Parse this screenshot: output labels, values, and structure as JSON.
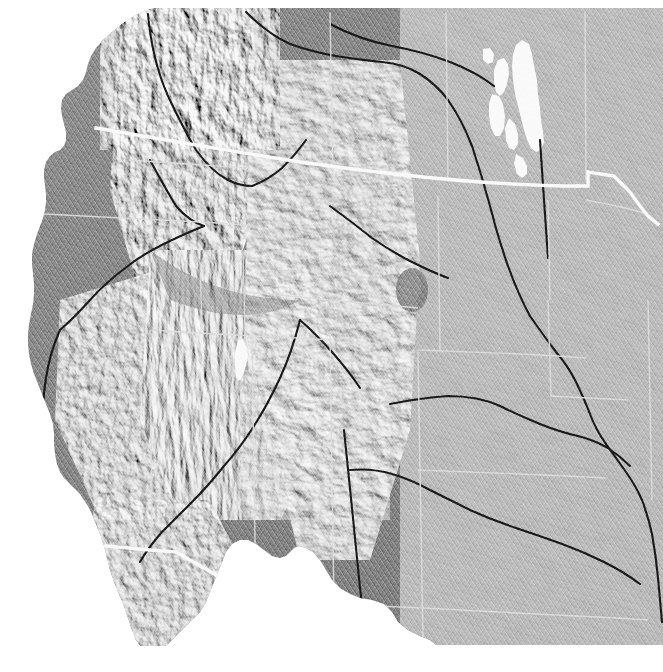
{
  "figure": {
    "kind": "shaded-relief-map",
    "title": "Shaded relief map of the western United States",
    "projection": "Albers Equal Area Conic",
    "rendering": "grayscale hillshade, illumination from the northwest",
    "width_px": 663,
    "height_px": 672,
    "caption": ""
  },
  "colors": {
    "background": "#ffffff",
    "ocean": "#ffffff",
    "land_base": "#8a8a8a",
    "land_low": "#8f8f8f",
    "land_high": "#9a9a9a",
    "shadow": "#3d3d3d",
    "highlight": "#f2f2f2",
    "lake": "#ffffff",
    "international_border": "#ffffff",
    "state_border": "#e6e6e6",
    "river": "#1a1a1a"
  },
  "layers": [
    {
      "id": "ocean",
      "label": "Ocean / no-data",
      "color": "#ffffff",
      "visible": true
    },
    {
      "id": "hillshade",
      "label": "Shaded relief (hillshade)",
      "color": "#8a8a8a",
      "visible": true
    },
    {
      "id": "lakes",
      "label": "Lakes",
      "color": "#ffffff",
      "visible": true
    },
    {
      "id": "rivers",
      "label": "Major rivers",
      "color": "#1a1a1a",
      "visible": true
    },
    {
      "id": "state-boundaries",
      "label": "State boundaries",
      "color": "#e6e6e6",
      "visible": true
    },
    {
      "id": "international-border",
      "label": "International boundaries",
      "color": "#ffffff",
      "visible": true
    }
  ],
  "water_bodies": [
    {
      "name": "Pacific Ocean",
      "type": "ocean"
    },
    {
      "name": "Puget Sound",
      "type": "sound"
    },
    {
      "name": "Strait of Georgia",
      "type": "strait"
    },
    {
      "name": "Gulf of California",
      "type": "gulf"
    },
    {
      "name": "Great Salt Lake",
      "type": "lake"
    },
    {
      "name": "Lake Winnipeg",
      "type": "lake"
    },
    {
      "name": "Lake Manitoba",
      "type": "lake"
    },
    {
      "name": "Lake Winnipegosis",
      "type": "lake"
    },
    {
      "name": "Gulf of Mexico",
      "type": "gulf"
    }
  ],
  "rivers": [
    {
      "name": "Missouri River"
    },
    {
      "name": "Mississippi River"
    },
    {
      "name": "Colorado River"
    },
    {
      "name": "Snake River"
    },
    {
      "name": "Columbia River"
    },
    {
      "name": "Rio Grande"
    },
    {
      "name": "Arkansas River"
    },
    {
      "name": "Platte River"
    },
    {
      "name": "Yellowstone River"
    },
    {
      "name": "Red River of the North"
    }
  ],
  "landforms": [
    {
      "name": "Cascade Range"
    },
    {
      "name": "Coast Ranges"
    },
    {
      "name": "Sierra Nevada"
    },
    {
      "name": "Great Basin"
    },
    {
      "name": "Rocky Mountains"
    },
    {
      "name": "Colorado Plateau"
    },
    {
      "name": "Wasatch Range"
    },
    {
      "name": "Snake River Plain"
    },
    {
      "name": "Black Hills"
    },
    {
      "name": "Great Plains"
    },
    {
      "name": "Baja California Peninsula"
    },
    {
      "name": "Central Valley"
    }
  ],
  "borders": [
    {
      "name": "United States – Canada border",
      "style": "thick white line"
    },
    {
      "name": "United States – Mexico border",
      "style": "thick white line"
    },
    {
      "name": "State boundaries",
      "style": "thin light grey line"
    }
  ]
}
